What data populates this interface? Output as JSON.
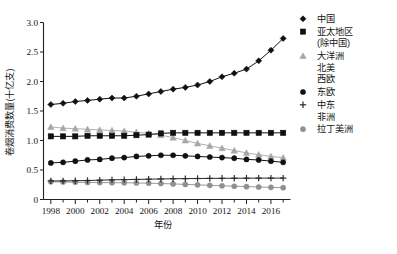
{
  "figure": {
    "background": "#ffffff",
    "caption": ""
  },
  "chart_data": {
    "type": "line",
    "title": "",
    "xlabel": "年份",
    "ylabel": "卷烟消费数量(十亿支)",
    "xlim": [
      1997.4,
      2017.6
    ],
    "ylim": [
      0,
      3.0
    ],
    "yticks": [
      "0",
      "0.5",
      "1.0",
      "1.5",
      "2.0",
      "2.5",
      "3.0"
    ],
    "ytick_values": [
      0,
      0.5,
      1.0,
      1.5,
      2.0,
      2.5,
      3.0
    ],
    "xticks": [
      "1998",
      "2000",
      "2002",
      "2004",
      "2006",
      "2008",
      "2010",
      "2012",
      "2014",
      "2016"
    ],
    "xtick_values": [
      1998,
      2000,
      2002,
      2004,
      2006,
      2008,
      2010,
      2012,
      2014,
      2016
    ],
    "minor_xticks": [
      1999,
      2001,
      2003,
      2005,
      2007,
      2009,
      2011,
      2013,
      2015,
      2017
    ],
    "grid": false,
    "legend_position": "right",
    "x": [
      1998,
      1999,
      2000,
      2001,
      2002,
      2003,
      2004,
      2005,
      2006,
      2007,
      2008,
      2009,
      2010,
      2011,
      2012,
      2013,
      2014,
      2015,
      2016,
      2017
    ],
    "series": [
      {
        "name": "中国",
        "marker": "diamond",
        "color": "#101010",
        "line_color": "#101010",
        "values": [
          1.61,
          1.63,
          1.66,
          1.68,
          1.7,
          1.72,
          1.72,
          1.75,
          1.79,
          1.83,
          1.87,
          1.9,
          1.94,
          2.0,
          2.08,
          2.14,
          2.21,
          2.35,
          2.53,
          2.73
        ]
      },
      {
        "name": "亚太地区(除中国)",
        "marker": "square",
        "color": "#101010",
        "line_color": "#101010",
        "values": [
          1.07,
          1.07,
          1.07,
          1.08,
          1.08,
          1.08,
          1.08,
          1.09,
          1.1,
          1.12,
          1.13,
          1.13,
          1.13,
          1.13,
          1.13,
          1.13,
          1.13,
          1.13,
          1.13,
          1.13
        ]
      },
      {
        "name": "大洋洲 北美 西欧",
        "marker": "triangle",
        "color": "#a6a6a6",
        "line_color": "#a6a6a6",
        "values": [
          1.23,
          1.21,
          1.2,
          1.19,
          1.18,
          1.17,
          1.16,
          1.14,
          1.12,
          1.09,
          1.05,
          1.0,
          0.95,
          0.91,
          0.87,
          0.83,
          0.79,
          0.76,
          0.73,
          0.71
        ]
      },
      {
        "name": "东欧",
        "marker": "circle",
        "color": "#101010",
        "line_color": "#101010",
        "values": [
          0.62,
          0.63,
          0.65,
          0.67,
          0.68,
          0.7,
          0.71,
          0.73,
          0.74,
          0.75,
          0.75,
          0.74,
          0.73,
          0.72,
          0.71,
          0.7,
          0.68,
          0.67,
          0.65,
          0.63
        ]
      },
      {
        "name": "中东 非洲",
        "marker": "plus",
        "color": "#2b2b2b",
        "line_color": "#2b2b2b",
        "values": [
          0.315,
          0.315,
          0.318,
          0.322,
          0.328,
          0.333,
          0.337,
          0.34,
          0.344,
          0.348,
          0.352,
          0.354,
          0.356,
          0.358,
          0.359,
          0.36,
          0.361,
          0.362,
          0.362,
          0.363
        ]
      },
      {
        "name": "拉丁美洲",
        "marker": "circle-gray",
        "color": "#8f8f8f",
        "line_color": "#8f8f8f",
        "values": [
          0.3,
          0.296,
          0.292,
          0.289,
          0.287,
          0.285,
          0.283,
          0.28,
          0.276,
          0.271,
          0.264,
          0.256,
          0.248,
          0.24,
          0.232,
          0.225,
          0.218,
          0.212,
          0.206,
          0.2
        ]
      }
    ]
  },
  "legend": {
    "entries": [
      {
        "label": "中国",
        "lines": [
          "中国"
        ],
        "marker": "diamond",
        "color": "#101010"
      },
      {
        "label": "亚太地区(除中国)",
        "lines": [
          "亚太地区",
          "(除中国)"
        ],
        "marker": "square",
        "color": "#101010"
      },
      {
        "label": "大洋洲 北美 西欧",
        "lines": [
          "大洋洲",
          "北美",
          "西欧"
        ],
        "marker": "triangle",
        "color": "#a6a6a6"
      },
      {
        "label": "东欧",
        "lines": [
          "东欧"
        ],
        "marker": "circle",
        "color": "#101010"
      },
      {
        "label": "中东 非洲",
        "lines": [
          "中东",
          "非洲"
        ],
        "marker": "plus",
        "color": "#2b2b2b"
      },
      {
        "label": "拉丁美洲",
        "lines": [
          "拉丁美洲"
        ],
        "marker": "circle-gray",
        "color": "#8f8f8f"
      }
    ]
  }
}
